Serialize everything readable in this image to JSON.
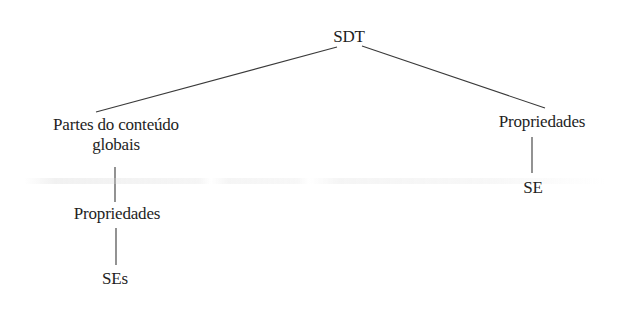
{
  "diagram": {
    "type": "tree",
    "root": {
      "id": "sdt",
      "label": "SDT"
    },
    "nodes": {
      "sdt": {
        "label": "SDT",
        "x": 349,
        "y": 27
      },
      "partes": {
        "label_line1": "Partes do conteúdo",
        "label_line2": "globais",
        "x": 116,
        "y": 115
      },
      "propriedades_left": {
        "label": "Propriedades",
        "x": 117,
        "y": 204
      },
      "ses": {
        "label": "SEs",
        "x": 115,
        "y": 269
      },
      "propriedades_right": {
        "label": "Propriedades",
        "x": 542,
        "y": 112
      },
      "se": {
        "label": "SE",
        "x": 533,
        "y": 178
      }
    },
    "edges": [
      {
        "from": "sdt",
        "to": "partes",
        "x1": 337,
        "y1": 47,
        "x2": 96,
        "y2": 112
      },
      {
        "from": "sdt",
        "to": "propriedades_right",
        "x1": 362,
        "y1": 46,
        "x2": 545,
        "y2": 108
      },
      {
        "from": "partes",
        "to": "propriedades_left",
        "x1": 115,
        "y1": 167,
        "x2": 115,
        "y2": 202
      },
      {
        "from": "propriedades_left",
        "to": "ses",
        "x1": 116,
        "y1": 228,
        "x2": 116,
        "y2": 265
      },
      {
        "from": "propriedades_right",
        "to": "se",
        "x1": 532,
        "y1": 137,
        "x2": 532,
        "y2": 173
      }
    ],
    "line_color": "#3a3a3a",
    "text_color": "#1e1e1e",
    "background": "#ffffff"
  }
}
